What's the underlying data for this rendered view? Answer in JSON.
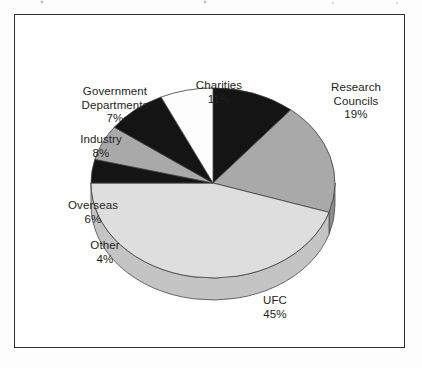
{
  "figure": {
    "background_color": "#fdfdfd",
    "frame_color": "#2e2e2e",
    "label_color": "#231f20"
  },
  "chart_data": {
    "type": "pie",
    "title": "",
    "subtitle": "",
    "xlabel": "",
    "ylabel": "",
    "legend_position": "none",
    "grid": false,
    "style": "3d-exploded-none",
    "start_angle_deg": 0,
    "direction": "clockwise",
    "units": "percent",
    "total": 100,
    "categories": [
      "Charities",
      "Research Councils",
      "UFC",
      "Other",
      "Overseas",
      "Industry",
      "Government Departments"
    ],
    "values": [
      11,
      19,
      45,
      4,
      6,
      8,
      7
    ],
    "colors": [
      "#141414",
      "#a9a9a9",
      "#dedede",
      "#141414",
      "#a9a9a9",
      "#141414",
      "#fdfdfd"
    ],
    "slices": [
      {
        "label": "Charities",
        "value": 11,
        "value_text": "11%",
        "color": "#141414",
        "side_color": "#0d0d0d"
      },
      {
        "label": "Research Councils",
        "value": 19,
        "value_text": "19%",
        "color": "#a9a9a9",
        "side_color": "#8d8d8d"
      },
      {
        "label": "UFC",
        "value": 45,
        "value_text": "45%",
        "color": "#dedede",
        "side_color": "#c4c4c4"
      },
      {
        "label": "Other",
        "value": 4,
        "value_text": "4%",
        "color": "#141414",
        "side_color": "#0d0d0d"
      },
      {
        "label": "Overseas",
        "value": 6,
        "value_text": "6%",
        "color": "#a9a9a9",
        "side_color": "#8d8d8d"
      },
      {
        "label": "Industry",
        "value": 8,
        "value_text": "8%",
        "color": "#141414",
        "side_color": "#0d0d0d"
      },
      {
        "label": "Government Departments",
        "value": 7,
        "value_text": "7%",
        "color": "#fdfdfd",
        "side_color": "#e2e2e2"
      }
    ]
  },
  "labels": {
    "charities": "Charities\n11%",
    "research": "Research\nCouncils\n19%",
    "government": "Government\nDepartments\n7%",
    "industry": "Industry\n8%",
    "overseas": "Overseas\n6%",
    "other": "Other\n4%",
    "ufc": "UFC\n45%"
  }
}
